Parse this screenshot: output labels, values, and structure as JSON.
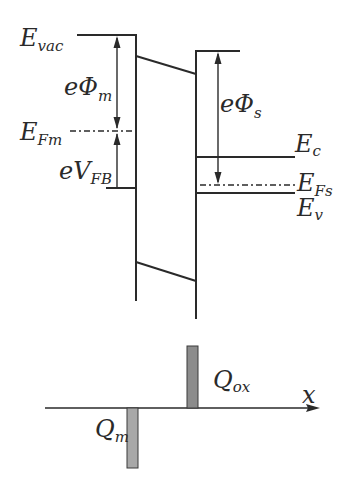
{
  "diagram": {
    "labels": {
      "e_vac": {
        "main": "E",
        "sub": "vac"
      },
      "e_phi_m": {
        "main": "eΦ",
        "sub": "m"
      },
      "e_fm": {
        "main": "E",
        "sub": "Fm"
      },
      "e_v_fb": {
        "main": "eV",
        "sub": "FB"
      },
      "e_phi_s": {
        "main": "eΦ",
        "sub": "s"
      },
      "e_c": {
        "main": "E",
        "sub": "c"
      },
      "e_fs": {
        "main": "E",
        "sub": "Fs"
      },
      "e_v": {
        "main": "E",
        "sub": "v"
      },
      "q_ox": {
        "main": "Q",
        "sub": "ox"
      },
      "q_m": {
        "main": "Q",
        "sub": "m"
      },
      "x_axis": "x"
    },
    "colors": {
      "line": "#2a2a2a",
      "charge_bar_fill": "#8c8c8c",
      "charge_bar_fill_light": "#a8a8a8"
    }
  }
}
